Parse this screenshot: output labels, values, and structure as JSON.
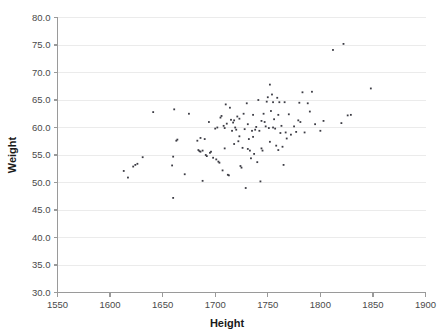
{
  "chart_data": {
    "type": "scatter",
    "title": "",
    "xlabel": "Height",
    "ylabel": "Weight",
    "xlim": [
      1550,
      1900
    ],
    "ylim": [
      30.0,
      80.0
    ],
    "xticks": [
      1550,
      1600,
      1650,
      1700,
      1750,
      1800,
      1850,
      1900
    ],
    "xtick_labels": [
      "1550",
      "1600",
      "1650",
      "1700",
      "1750",
      "1800",
      "1850",
      "1900"
    ],
    "yticks": [
      30.0,
      35.0,
      40.0,
      45.0,
      50.0,
      55.0,
      60.0,
      65.0,
      70.0,
      75.0,
      80.0
    ],
    "ytick_labels": [
      "30.0",
      "35.0",
      "40.0",
      "45.0",
      "50.0",
      "55.0",
      "60.0",
      "65.0",
      "70.0",
      "75.0",
      "80.0"
    ],
    "grid": "horizontal",
    "legend": "none",
    "marker_color": "#3c3c44",
    "grid_color": "#ebebeb",
    "axis_color": "#9a9a9a",
    "background_color": "#ffffff",
    "point_count": 128,
    "points": [
      [
        1613,
        52.1
      ],
      [
        1617,
        50.9
      ],
      [
        1622,
        52.9
      ],
      [
        1624,
        53.2
      ],
      [
        1626,
        53.4
      ],
      [
        1631,
        54.6
      ],
      [
        1641,
        62.8
      ],
      [
        1659,
        53.1
      ],
      [
        1660,
        54.7
      ],
      [
        1660,
        47.2
      ],
      [
        1661,
        63.3
      ],
      [
        1663,
        57.6
      ],
      [
        1664,
        57.8
      ],
      [
        1671,
        51.5
      ],
      [
        1675,
        62.5
      ],
      [
        1683,
        57.6
      ],
      [
        1684,
        55.9
      ],
      [
        1685,
        55.7
      ],
      [
        1686,
        55.6
      ],
      [
        1686,
        58.1
      ],
      [
        1688,
        55.8
      ],
      [
        1688,
        50.3
      ],
      [
        1690,
        57.9
      ],
      [
        1691,
        55.0
      ],
      [
        1692,
        54.8
      ],
      [
        1694,
        61.0
      ],
      [
        1695,
        55.4
      ],
      [
        1696,
        55.6
      ],
      [
        1698,
        54.5
      ],
      [
        1700,
        59.8
      ],
      [
        1701,
        54.2
      ],
      [
        1702,
        60.0
      ],
      [
        1703,
        53.8
      ],
      [
        1704,
        53.6
      ],
      [
        1705,
        61.8
      ],
      [
        1706,
        62.1
      ],
      [
        1707,
        52.2
      ],
      [
        1708,
        60.3
      ],
      [
        1709,
        59.9
      ],
      [
        1710,
        64.2
      ],
      [
        1711,
        60.7
      ],
      [
        1712,
        51.4
      ],
      [
        1713,
        51.3
      ],
      [
        1714,
        63.6
      ],
      [
        1715,
        61.4
      ],
      [
        1716,
        59.4
      ],
      [
        1717,
        60.9
      ],
      [
        1718,
        61.3
      ],
      [
        1719,
        60.0
      ],
      [
        1720,
        59.6
      ],
      [
        1721,
        62.0
      ],
      [
        1722,
        57.5
      ],
      [
        1723,
        61.6
      ],
      [
        1724,
        53.0
      ],
      [
        1725,
        52.7
      ],
      [
        1726,
        56.3
      ],
      [
        1727,
        62.5
      ],
      [
        1728,
        59.7
      ],
      [
        1729,
        49.0
      ],
      [
        1730,
        64.4
      ],
      [
        1731,
        56.1
      ],
      [
        1732,
        57.9
      ],
      [
        1733,
        55.8
      ],
      [
        1734,
        54.4
      ],
      [
        1735,
        59.4
      ],
      [
        1736,
        62.3
      ],
      [
        1737,
        55.2
      ],
      [
        1738,
        59.6
      ],
      [
        1739,
        60.1
      ],
      [
        1740,
        53.7
      ],
      [
        1741,
        65.0
      ],
      [
        1742,
        59.4
      ],
      [
        1743,
        50.2
      ],
      [
        1744,
        56.2
      ],
      [
        1745,
        55.8
      ],
      [
        1746,
        62.5
      ],
      [
        1747,
        61.0
      ],
      [
        1748,
        60.2
      ],
      [
        1749,
        64.7
      ],
      [
        1750,
        65.5
      ],
      [
        1751,
        59.9
      ],
      [
        1752,
        67.8
      ],
      [
        1753,
        63.0
      ],
      [
        1754,
        66.0
      ],
      [
        1755,
        60.0
      ],
      [
        1755,
        64.6
      ],
      [
        1756,
        61.5
      ],
      [
        1757,
        59.8
      ],
      [
        1758,
        56.7
      ],
      [
        1759,
        65.4
      ],
      [
        1760,
        62.3
      ],
      [
        1761,
        64.6
      ],
      [
        1762,
        59.0
      ],
      [
        1763,
        60.3
      ],
      [
        1764,
        56.5
      ],
      [
        1765,
        53.2
      ],
      [
        1766,
        64.6
      ],
      [
        1767,
        59.1
      ],
      [
        1768,
        58.0
      ],
      [
        1770,
        62.4
      ],
      [
        1772,
        58.7
      ],
      [
        1775,
        60.2
      ],
      [
        1777,
        59.2
      ],
      [
        1779,
        61.3
      ],
      [
        1780,
        64.5
      ],
      [
        1781,
        61.0
      ],
      [
        1783,
        66.4
      ],
      [
        1785,
        59.1
      ],
      [
        1788,
        64.4
      ],
      [
        1790,
        62.9
      ],
      [
        1792,
        66.5
      ],
      [
        1795,
        60.6
      ],
      [
        1800,
        59.4
      ],
      [
        1803,
        61.2
      ],
      [
        1812,
        74.1
      ],
      [
        1820,
        60.8
      ],
      [
        1822,
        75.2
      ],
      [
        1826,
        62.2
      ],
      [
        1829,
        62.3
      ],
      [
        1848,
        67.1
      ],
      [
        1709,
        56.2
      ],
      [
        1718,
        57.0
      ],
      [
        1736,
        58.3
      ],
      [
        1744,
        61.2
      ],
      [
        1752,
        57.4
      ],
      [
        1760,
        55.9
      ],
      [
        1731,
        60.6
      ],
      [
        1723,
        58.4
      ]
    ]
  }
}
